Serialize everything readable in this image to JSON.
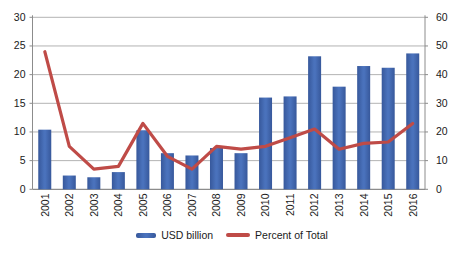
{
  "chart_data": {
    "type": "bar",
    "subtype": "combo-bar-line",
    "title": "",
    "categories": [
      "2001",
      "2002",
      "2003",
      "2004",
      "2005",
      "2006",
      "2007",
      "2008",
      "2009",
      "2010",
      "2011",
      "2012",
      "2013",
      "2014",
      "2015",
      "2016"
    ],
    "series": [
      {
        "name": "USD billion",
        "type": "bar",
        "axis": "left",
        "color": "#3e63ac",
        "values": [
          10.4,
          2.4,
          2.1,
          3.0,
          10.3,
          6.3,
          5.9,
          7.2,
          6.3,
          16.0,
          16.2,
          23.2,
          17.9,
          21.5,
          21.2,
          23.7
        ]
      },
      {
        "name": "Percent of Total",
        "type": "line",
        "axis": "right",
        "color": "#bf4b47",
        "values": [
          48,
          15,
          7,
          8,
          23,
          11.5,
          7,
          15,
          14,
          15,
          18,
          21,
          14,
          16,
          16.5,
          23
        ]
      }
    ],
    "left_axis": {
      "min": 0,
      "max": 30,
      "tick_labels": [
        "0",
        "5",
        "10",
        "15",
        "20",
        "25",
        "30"
      ]
    },
    "right_axis": {
      "min": 0,
      "max": 60,
      "tick_labels": [
        "0",
        "10",
        "20",
        "30",
        "40",
        "50",
        "60"
      ]
    },
    "grid": true,
    "legend_position": "bottom",
    "colors": {
      "bar_edge": "#37589b",
      "bar_center": "#4a72bc",
      "line": "#bf4b47",
      "gridline": "#b3b3b3",
      "axis_line": "#8c8c8c",
      "text": "#1a1a1a"
    }
  },
  "legend": {
    "usd_billion_label": "USD billion",
    "percent_label": "Percent of Total"
  }
}
